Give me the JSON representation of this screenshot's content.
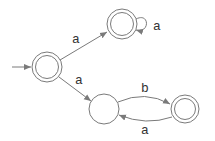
{
  "diagram": {
    "type": "finite-automaton",
    "colors": {
      "stroke": "#7a7a7a",
      "label": "#333333",
      "background": "#ffffff"
    },
    "states": [
      {
        "id": "q0",
        "accepting": true,
        "start": true
      },
      {
        "id": "q1",
        "accepting": true,
        "start": false
      },
      {
        "id": "q2",
        "accepting": false,
        "start": false
      },
      {
        "id": "q3",
        "accepting": true,
        "start": false
      }
    ],
    "transitions": [
      {
        "from": "q0",
        "to": "q1",
        "label": "a"
      },
      {
        "from": "q1",
        "to": "q1",
        "label": "a"
      },
      {
        "from": "q0",
        "to": "q2",
        "label": "a"
      },
      {
        "from": "q2",
        "to": "q3",
        "label": "b"
      },
      {
        "from": "q3",
        "to": "q2",
        "label": "a"
      }
    ]
  }
}
